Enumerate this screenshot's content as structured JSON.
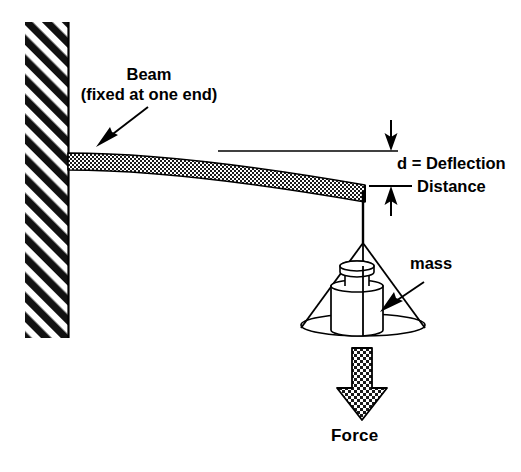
{
  "figure": {
    "type": "engineering-schematic",
    "title_visible": false,
    "background_color": "#ffffff",
    "line_color": "#000000"
  },
  "labels": {
    "beam": "Beam",
    "beam_sub": "(fixed at one end)",
    "deflection_line1": "d = Deflection",
    "deflection_line2": "Distance",
    "mass": "mass",
    "force": "Force"
  },
  "icons": {
    "wall": "hatched-wall-icon",
    "beam": "stippled-beam-icon",
    "weight": "lab-weight-icon",
    "cone": "suspension-cone-icon",
    "force_arrow": "downward-block-arrow-icon",
    "beam_pointer": "pointer-arrow-icon",
    "mass_pointer": "pointer-arrow-icon",
    "dimension_arrow_top": "down-arrow-icon",
    "dimension_arrow_bottom": "up-arrow-icon"
  },
  "geometry": {
    "wall": {
      "x": 25,
      "y": 22,
      "width": 43,
      "height": 316,
      "hatch_angle_deg": 45
    },
    "beam": {
      "root_x": 68,
      "root_y": 153,
      "tip_x": 365,
      "tip_y": 185,
      "thickness": 17
    },
    "reference_line": {
      "x1": 218,
      "y": 151,
      "x2": 398
    },
    "dimension": {
      "x": 391,
      "y_top": 120,
      "y_bottom": 216,
      "span_top": 151,
      "span_bottom": 186
    },
    "string": {
      "x": 363,
      "y_top": 190,
      "y_bottom": 243
    },
    "cone": {
      "apex_x": 363,
      "apex_y": 243,
      "base_cx": 363,
      "base_cy": 325,
      "base_rx": 62,
      "base_ry": 11
    },
    "weight": {
      "cx": 357,
      "body_top": 283,
      "body_bottom": 330,
      "body_width": 52
    },
    "force_arrow": {
      "x": 362,
      "y_top": 348,
      "y_point": 420,
      "shaft_width": 21,
      "head_width": 50
    }
  }
}
